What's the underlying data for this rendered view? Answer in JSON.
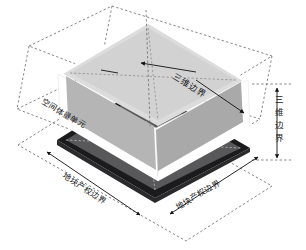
{
  "figure": {
    "type": "isometric-3d-cadastre-diagram",
    "background_color": "#ffffff"
  },
  "labels": {
    "volume_top_boundary": "三维边界",
    "volume_unit": "空间体量单元",
    "vertical_boundary": "三维边界",
    "vertical_boundary_chars": [
      "三",
      "维",
      "边",
      "界"
    ],
    "parcel_boundary_left": "地块产权边界",
    "parcel_boundary_right": "地块产权边界"
  },
  "colors": {
    "parcel_fill": "#58585a",
    "parcel_edge": "#111111",
    "volume_floor": "#dcdcdc",
    "volume_wall_right": "#a9a9a9",
    "volume_wall_front": "#b5b5b5",
    "volume_rim": "#ffffff",
    "dashed_guide": "#5a5a5a",
    "annotation": "#1a1a1a"
  },
  "geometry": {
    "parcel_polygon": [
      [
        57,
        140
      ],
      [
        143,
        86
      ],
      [
        250,
        148
      ],
      [
        155,
        198
      ]
    ],
    "volume_floor_polygon": [
      [
        62,
        73
      ],
      [
        148,
        22
      ],
      [
        244,
        80
      ],
      [
        158,
        126
      ]
    ],
    "outer_box_top_polygon": [
      [
        28,
        48
      ],
      [
        114,
        8
      ],
      [
        268,
        58
      ],
      [
        186,
        110
      ]
    ],
    "note": "isometric projection, dashed outer bounding box encloses the volume unit"
  }
}
